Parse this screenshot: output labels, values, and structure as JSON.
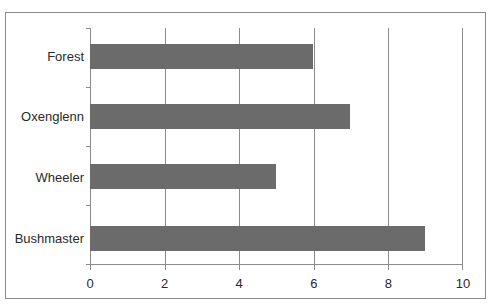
{
  "chart_data": {
    "type": "bar",
    "orientation": "horizontal",
    "title": "",
    "xlabel": "",
    "ylabel": "",
    "categories": [
      "Forest",
      "Oxenglenn",
      "Wheeler",
      "Bushmaster"
    ],
    "values": [
      6,
      7,
      5,
      9
    ],
    "xlim": [
      0,
      10
    ],
    "x_ticks": [
      "0",
      "2",
      "4",
      "6",
      "8",
      "10"
    ],
    "grid": true,
    "legend": null,
    "bar_color": "#6b6b6b"
  }
}
